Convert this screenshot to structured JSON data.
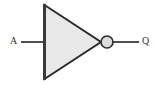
{
  "diagram": {
    "type": "logic-gate-schematic",
    "gate_type": "NOT",
    "background_color": "#ffffff",
    "canvas": {
      "width": 158,
      "height": 85
    }
  },
  "symbol": {
    "body": {
      "name": "inverter-triangle",
      "shape": "triangle",
      "fill_color": "#e8e8e8",
      "stroke_color": "#2b2b2b",
      "stroke_width": 2,
      "points": "44,5 44,79 101,42",
      "left_edge_x": 44,
      "top_y": 5,
      "bottom_y": 79,
      "apex_x": 101,
      "apex_y": 42
    },
    "bubble": {
      "name": "inversion-bubble",
      "shape": "circle",
      "fill_color": "#dcdcdc",
      "stroke_color": "#2b2b2b",
      "stroke_width": 1.6,
      "center_x": 107,
      "center_y": 42,
      "radius": 6
    },
    "left_spine": {
      "name": "gate-left-edge",
      "stroke_color": "#3a3a3a",
      "stroke_width": 3,
      "x": 44,
      "y1": 4,
      "y2": 80
    }
  },
  "wires": [
    {
      "name": "input-wire",
      "from_x": 21,
      "to_x": 44,
      "y": 42,
      "stroke_color": "#3a3a3a",
      "stroke_width": 1.8
    },
    {
      "name": "output-wire",
      "from_x": 113,
      "to_x": 139,
      "y": 42,
      "stroke_color": "#3a3a3a",
      "stroke_width": 1.8
    }
  ],
  "labels": {
    "input": {
      "text": "A",
      "name": "input-label-a",
      "x": 10,
      "y": 36,
      "color": "#333333",
      "font_size": 10
    },
    "output": {
      "text": "Q",
      "name": "output-label-q",
      "x": 142,
      "y": 36,
      "color": "#333333",
      "font_size": 10
    }
  }
}
